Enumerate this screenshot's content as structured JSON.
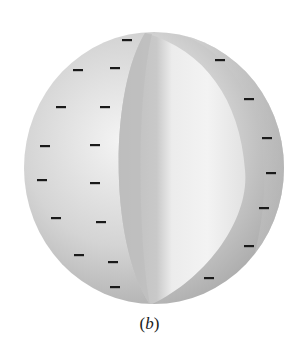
{
  "figure": {
    "caption_open": "(",
    "caption_letter": "b",
    "caption_close": ")",
    "colors": {
      "background": "#ffffff",
      "sphere_light": "#f1f1f1",
      "sphere_mid": "#cfcfcf",
      "sphere_dark": "#a9a9a9",
      "charge": "#1a1a1a"
    },
    "sphere": {
      "cx": 154,
      "cy": 168,
      "rx": 130,
      "ry": 136
    },
    "charge_symbol": "−",
    "charges": [
      {
        "x": 127,
        "y": 40
      },
      {
        "x": 78,
        "y": 70
      },
      {
        "x": 115,
        "y": 68
      },
      {
        "x": 61,
        "y": 107
      },
      {
        "x": 105,
        "y": 107
      },
      {
        "x": 45,
        "y": 146
      },
      {
        "x": 95,
        "y": 145
      },
      {
        "x": 42,
        "y": 180
      },
      {
        "x": 95,
        "y": 183
      },
      {
        "x": 56,
        "y": 218
      },
      {
        "x": 101,
        "y": 222
      },
      {
        "x": 79,
        "y": 255
      },
      {
        "x": 113,
        "y": 262
      },
      {
        "x": 115,
        "y": 287
      },
      {
        "x": 220,
        "y": 60
      },
      {
        "x": 249,
        "y": 99
      },
      {
        "x": 267,
        "y": 138
      },
      {
        "x": 271,
        "y": 173
      },
      {
        "x": 264,
        "y": 208
      },
      {
        "x": 249,
        "y": 246
      },
      {
        "x": 209,
        "y": 278
      }
    ]
  }
}
